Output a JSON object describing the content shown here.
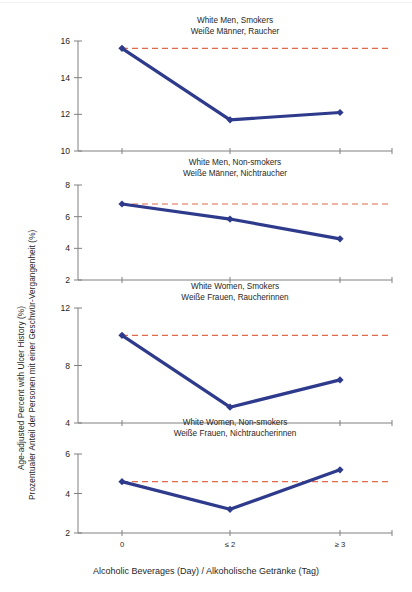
{
  "figure": {
    "width": 412,
    "height": 592,
    "background": "#ffffff"
  },
  "axis_titles": {
    "y_line1": "Age-adjusted Percent with Ulcer History (%)",
    "y_line2": "Prozentualer Anteil der Personen mit einer Geschwür-Vergangenheit (%)",
    "x": "Alcoholic Beverages (Day) / Alkoholische Getränke (Tag)"
  },
  "colors": {
    "series_line": "#2e3a8c",
    "series_marker": "#2e3a8c",
    "reference_line": "#e06a4a",
    "axis": "#808080",
    "text": "#1f1f1f"
  },
  "x_categories": [
    "0",
    "≤ 2",
    "≥ 3"
  ],
  "chart_data": [
    {
      "type": "line",
      "title": "White Men, Smokers",
      "subtitle": "Weiße Männer, Raucher",
      "xlabel": "Alcoholic Beverages (Day) / Alkoholische Getränke (Tag)",
      "ylabel": "Age-adjusted Percent with Ulcer History (%)",
      "categories": [
        "0",
        "≤ 2",
        "≥ 3"
      ],
      "values": [
        15.6,
        11.7,
        12.1
      ],
      "ylim": [
        10,
        16
      ],
      "yticks": [
        10,
        12,
        14,
        16
      ],
      "reference_line": 15.6,
      "grid": false,
      "legend": "none"
    },
    {
      "type": "line",
      "title": "White Men, Non-smokers",
      "subtitle": "Weiße Männer, Nichtraucher",
      "xlabel": "Alcoholic Beverages (Day) / Alkoholische Getränke (Tag)",
      "ylabel": "Age-adjusted Percent with Ulcer History (%)",
      "categories": [
        "0",
        "≤ 2",
        "≥ 3"
      ],
      "values": [
        6.8,
        5.85,
        4.6
      ],
      "ylim": [
        2,
        8
      ],
      "yticks": [
        2,
        4,
        6,
        8
      ],
      "reference_line": 6.8,
      "grid": false,
      "legend": "none"
    },
    {
      "type": "line",
      "title": "White Women, Smokers",
      "subtitle": "Weiße Frauen, Raucherinnen",
      "xlabel": "Alcoholic Beverages (Day) / Alkoholische Getränke (Tag)",
      "ylabel": "Age-adjusted Percent with Ulcer History (%)",
      "categories": [
        "0",
        "≤ 2",
        "≥ 3"
      ],
      "values": [
        10.1,
        5.1,
        7.0
      ],
      "ylim": [
        4,
        12
      ],
      "yticks": [
        4,
        8,
        12
      ],
      "reference_line": 10.1,
      "grid": false,
      "legend": "none"
    },
    {
      "type": "line",
      "title": "White Women, Non-smokers",
      "subtitle": "Weiße Frauen, Nichtraucherinnen",
      "xlabel": "Alcoholic Beverages (Day) / Alkoholische Getränke (Tag)",
      "ylabel": "Age-adjusted Percent with Ulcer History (%)",
      "categories": [
        "0",
        "≤ 2",
        "≥ 3"
      ],
      "values": [
        4.6,
        3.2,
        5.2
      ],
      "ylim": [
        2,
        6
      ],
      "yticks": [
        2,
        4,
        6
      ],
      "reference_line": 4.6,
      "grid": false,
      "legend": "none"
    }
  ],
  "panel_geometry": [
    {
      "top": 30,
      "plot_top": 41,
      "plot_bottom": 151
    },
    {
      "top": 172,
      "plot_top": 185,
      "plot_bottom": 280
    },
    {
      "top": 296,
      "plot_top": 308,
      "plot_bottom": 423
    },
    {
      "top": 432,
      "plot_top": 454,
      "plot_bottom": 533
    }
  ],
  "plot_x": {
    "left": 78,
    "right": 392,
    "points": [
      122,
      230,
      340
    ]
  }
}
